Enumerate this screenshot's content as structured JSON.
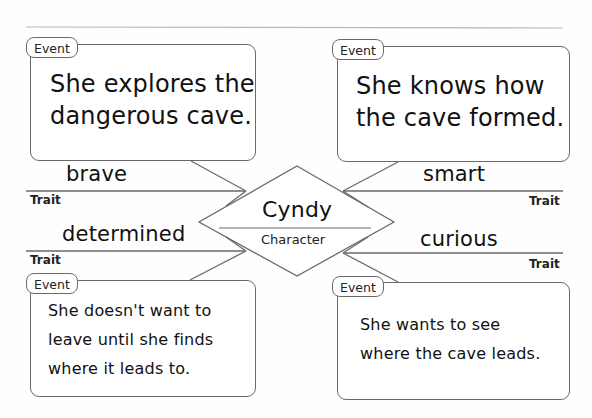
{
  "diagram": {
    "type": "character-traits-web",
    "character": {
      "name": "Cyndy",
      "label": "Character"
    },
    "traits": [
      {
        "id": "top-left",
        "word": "brave",
        "label": "Trait"
      },
      {
        "id": "top-right",
        "word": "smart",
        "label": "Trait"
      },
      {
        "id": "bottom-left",
        "word": "determined",
        "label": "Trait"
      },
      {
        "id": "bottom-right",
        "word": "curious",
        "label": "Trait"
      }
    ],
    "events": [
      {
        "id": "top-left",
        "label": "Event",
        "lines": [
          "She explores the",
          "dangerous cave."
        ]
      },
      {
        "id": "top-right",
        "label": "Event",
        "lines": [
          "She knows how",
          "the cave formed."
        ]
      },
      {
        "id": "bottom-left",
        "label": "Event",
        "lines": [
          "She doesn't want to",
          "leave until she finds",
          "where it leads to."
        ]
      },
      {
        "id": "bottom-right",
        "label": "Event",
        "lines": [
          "She wants to see",
          "where the cave leads."
        ]
      }
    ],
    "colors": {
      "line": "#6a6a6a",
      "text": "#111111",
      "background": "#fefefe"
    }
  }
}
